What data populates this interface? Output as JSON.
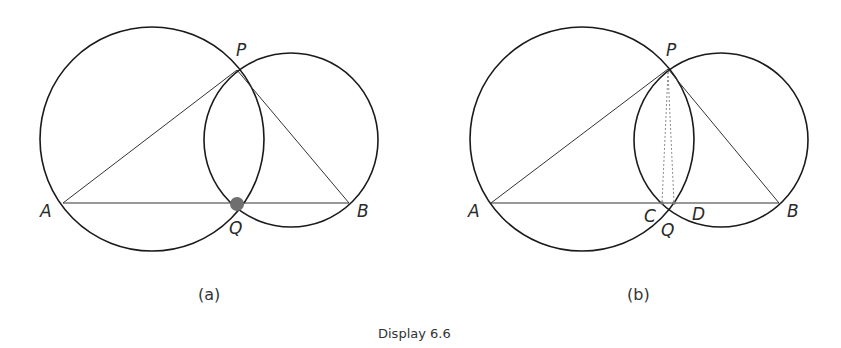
{
  "caption": "Display 6.6",
  "colors": {
    "stroke": "#1a1a1a",
    "thin": "#333333",
    "dot": "#6f6f6f",
    "dashed": "#8a8a8a"
  },
  "diagrams": [
    {
      "label": "(a)",
      "points": {
        "A": "A",
        "B": "B",
        "P": "P",
        "Q": "Q"
      },
      "notes": "Two intersecting circles through P and Q; triangle APB with AB through Q; Q marked with a filled dot"
    },
    {
      "label": "(b)",
      "points": {
        "A": "A",
        "B": "B",
        "P": "P",
        "Q": "Q",
        "C": "C",
        "D": "D"
      },
      "notes": "Same configuration; dotted segments PC and PD drop from P to points C and D on AB near Q"
    }
  ]
}
